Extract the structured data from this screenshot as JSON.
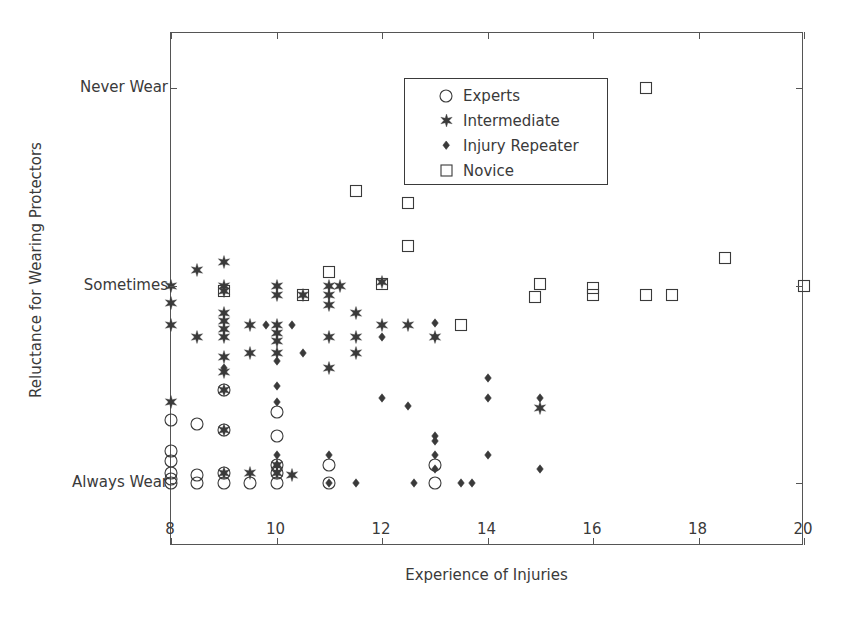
{
  "chart_data": {
    "type": "scatter",
    "title": "",
    "xlabel": "Experience of Injuries",
    "ylabel": "Reluctance for Wearing Protectors",
    "xlim": [
      8,
      20
    ],
    "ylim": [
      -0.32,
      2.28
    ],
    "xticks": [
      8,
      10,
      12,
      14,
      16,
      18,
      20
    ],
    "xticklabels": [
      "8",
      "10",
      "12",
      "14",
      "16",
      "18",
      "20"
    ],
    "yticks": [
      0,
      1,
      2
    ],
    "yticklabels": [
      "Always Wear",
      "Sometimes",
      "Never Wear"
    ],
    "grid": false,
    "legend_position": "upper left",
    "legend_entries": [
      "Experts",
      "Intermediate",
      "Injury Repeater",
      "Novice"
    ],
    "series": [
      {
        "name": "Experts",
        "marker": "circle-open",
        "points": [
          [
            8.0,
            0.32
          ],
          [
            8.0,
            0.16
          ],
          [
            8.0,
            0.11
          ],
          [
            8.0,
            0.05
          ],
          [
            8.0,
            0.02
          ],
          [
            8.0,
            0.0
          ],
          [
            8.5,
            0.3
          ],
          [
            8.5,
            0.04
          ],
          [
            8.5,
            0.0
          ],
          [
            9.0,
            0.47
          ],
          [
            9.0,
            0.27
          ],
          [
            9.0,
            0.05
          ],
          [
            9.0,
            0.0
          ],
          [
            9.5,
            0.0
          ],
          [
            10.0,
            0.36
          ],
          [
            10.0,
            0.24
          ],
          [
            10.0,
            0.09
          ],
          [
            10.0,
            0.05
          ],
          [
            10.0,
            0.0
          ],
          [
            11.0,
            0.09
          ],
          [
            11.0,
            0.0
          ],
          [
            13.0,
            0.09
          ],
          [
            13.0,
            0.0
          ]
        ]
      },
      {
        "name": "Intermediate",
        "marker": "star",
        "points": [
          [
            8.0,
            1.0
          ],
          [
            8.0,
            0.91
          ],
          [
            8.0,
            0.8
          ],
          [
            8.0,
            0.41
          ],
          [
            8.5,
            1.08
          ],
          [
            8.5,
            0.74
          ],
          [
            9.0,
            1.12
          ],
          [
            9.0,
            1.0
          ],
          [
            9.0,
            0.97
          ],
          [
            9.0,
            0.86
          ],
          [
            9.0,
            0.82
          ],
          [
            9.0,
            0.78
          ],
          [
            9.0,
            0.74
          ],
          [
            9.0,
            0.64
          ],
          [
            9.0,
            0.56
          ],
          [
            9.0,
            0.47
          ],
          [
            9.0,
            0.27
          ],
          [
            9.0,
            0.05
          ],
          [
            9.5,
            0.8
          ],
          [
            9.5,
            0.66
          ],
          [
            9.5,
            0.05
          ],
          [
            10.0,
            1.0
          ],
          [
            10.0,
            0.95
          ],
          [
            10.0,
            0.8
          ],
          [
            10.0,
            0.76
          ],
          [
            10.0,
            0.72
          ],
          [
            10.0,
            0.66
          ],
          [
            10.0,
            0.09
          ],
          [
            10.0,
            0.05
          ],
          [
            10.3,
            0.04
          ],
          [
            10.5,
            0.95
          ],
          [
            11.0,
            1.0
          ],
          [
            11.0,
            0.95
          ],
          [
            11.0,
            0.9
          ],
          [
            11.0,
            0.74
          ],
          [
            11.0,
            0.58
          ],
          [
            11.2,
            1.0
          ],
          [
            11.5,
            0.86
          ],
          [
            11.5,
            0.74
          ],
          [
            11.5,
            0.66
          ],
          [
            12.0,
            1.02
          ],
          [
            12.0,
            0.8
          ],
          [
            12.5,
            0.8
          ],
          [
            13.0,
            0.74
          ],
          [
            15.0,
            0.38
          ]
        ]
      },
      {
        "name": "Injury Repeater",
        "marker": "diamond-filled",
        "points": [
          [
            9.0,
            0.58
          ],
          [
            9.8,
            0.8
          ],
          [
            10.0,
            0.62
          ],
          [
            10.0,
            0.49
          ],
          [
            10.0,
            0.41
          ],
          [
            10.0,
            0.14
          ],
          [
            10.0,
            0.09
          ],
          [
            10.3,
            0.8
          ],
          [
            10.5,
            0.66
          ],
          [
            11.0,
            0.14
          ],
          [
            11.0,
            0.0
          ],
          [
            11.5,
            0.0
          ],
          [
            12.0,
            0.74
          ],
          [
            12.0,
            0.43
          ],
          [
            12.5,
            0.39
          ],
          [
            12.6,
            0.0
          ],
          [
            13.0,
            0.81
          ],
          [
            13.0,
            0.74
          ],
          [
            13.0,
            0.24
          ],
          [
            13.0,
            0.21
          ],
          [
            13.0,
            0.14
          ],
          [
            13.0,
            0.07
          ],
          [
            13.5,
            0.0
          ],
          [
            13.7,
            0.0
          ],
          [
            14.0,
            0.53
          ],
          [
            14.0,
            0.43
          ],
          [
            14.0,
            0.14
          ],
          [
            15.0,
            0.43
          ],
          [
            15.0,
            0.07
          ]
        ]
      },
      {
        "name": "Novice",
        "marker": "square-open",
        "points": [
          [
            9.0,
            0.97
          ],
          [
            10.5,
            0.95
          ],
          [
            11.0,
            1.07
          ],
          [
            11.5,
            1.48
          ],
          [
            12.0,
            1.01
          ],
          [
            12.5,
            1.42
          ],
          [
            12.5,
            1.2
          ],
          [
            13.5,
            0.8
          ],
          [
            14.9,
            0.94
          ],
          [
            15.0,
            1.01
          ],
          [
            16.0,
            0.99
          ],
          [
            16.0,
            0.95
          ],
          [
            17.0,
            2.0
          ],
          [
            17.0,
            0.95
          ],
          [
            17.5,
            0.95
          ],
          [
            18.5,
            1.14
          ],
          [
            20.0,
            1.0
          ]
        ]
      }
    ]
  },
  "axes": {
    "x_title": "Experience of Injuries",
    "y_title": "Reluctance for Wearing Protectors",
    "x_tick_labels": [
      "8",
      "10",
      "12",
      "14",
      "16",
      "18",
      "20"
    ],
    "y_tick_labels": [
      "Always Wear",
      "Sometimes",
      "Never Wear"
    ]
  },
  "legend": {
    "items": [
      {
        "label": "Experts",
        "marker": "circle-open"
      },
      {
        "label": "Intermediate",
        "marker": "star"
      },
      {
        "label": "Injury Repeater",
        "marker": "diamond-filled"
      },
      {
        "label": "Novice",
        "marker": "square-open"
      }
    ]
  },
  "colors": {
    "axis": "#555555",
    "text": "#3a3a3a",
    "marker": "#3a3a3a",
    "background": "#ffffff"
  }
}
